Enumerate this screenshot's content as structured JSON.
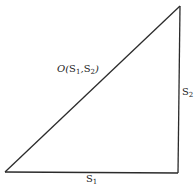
{
  "diagram": {
    "type": "right-triangle",
    "colors": {
      "line": "#2b2b2b",
      "text": "#222222",
      "background": "#ffffff"
    },
    "vertices": {
      "bottom_left": [
        5,
        172
      ],
      "bottom_right": [
        178,
        173
      ],
      "top_right": [
        180,
        6
      ]
    },
    "labels": {
      "hypotenuse": {
        "prefix": "O(",
        "s1_base": "S",
        "s1_sub": "1",
        "separator": ",",
        "s2_base": "S",
        "s2_sub": "2",
        "suffix": ")"
      },
      "vertical_side": {
        "base": "S",
        "sub": "2"
      },
      "horizontal_side": {
        "base": "S",
        "sub": "1"
      }
    }
  }
}
